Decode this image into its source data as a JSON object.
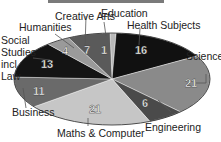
{
  "chart_data": {
    "type": "pie",
    "title": "",
    "start": "top",
    "direction": "clockwise",
    "slices": [
      {
        "label": "Education",
        "value": 1,
        "color": "#b8b8b8"
      },
      {
        "label": "Health Subjects",
        "value": 16,
        "color": "#111111"
      },
      {
        "label": "Science",
        "value": 21,
        "color": "#8a8a8a"
      },
      {
        "label": "Engineering",
        "value": 6,
        "color": "#4a4a4a"
      },
      {
        "label": "Maths & Computer",
        "value": 21,
        "color": "#c6c6c6"
      },
      {
        "label": "Business",
        "value": 11,
        "color": "#6a6a6a"
      },
      {
        "label": "Social Studies incl Law",
        "value": 13,
        "color": "#141414"
      },
      {
        "label": "Humanities",
        "value": 4,
        "color": "#9a9a9a"
      },
      {
        "label": "Creative Arts",
        "value": 7,
        "color": "#5a5a5a"
      }
    ],
    "total": 100
  },
  "labels": {
    "education": "Education",
    "health": "Health Subjects",
    "science": "Science",
    "engineering": "Engineering",
    "maths": "Maths & Computer",
    "business": "Business",
    "social_1": "Social",
    "social_2": "Studies",
    "social_3": "incl",
    "social_4": "Law",
    "humanities": "Humanities",
    "creative": "Creative Arts"
  },
  "values": {
    "education": "1",
    "health": "16",
    "science": "21",
    "engineering": "6",
    "maths": "21",
    "business": "11",
    "social": "13",
    "humanities": "4",
    "creative": "7"
  }
}
